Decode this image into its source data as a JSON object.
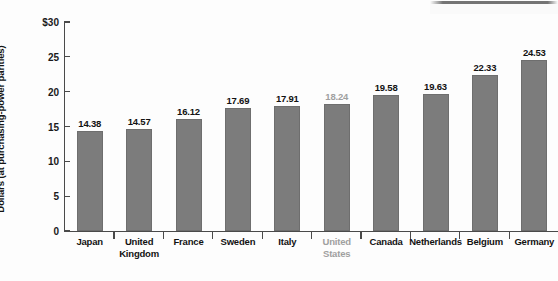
{
  "chart_data": {
    "type": "bar",
    "title": "",
    "xlabel": "",
    "ylabel": "Dollars (at purchasing-power parities)",
    "ylim": [
      0,
      30
    ],
    "ytick_labels": [
      "$30",
      "25",
      "20",
      "15",
      "10",
      "5",
      "0"
    ],
    "ytick_values": [
      30,
      25,
      20,
      15,
      10,
      5,
      0
    ],
    "grid": false,
    "legend": "none",
    "categories": [
      "Japan",
      "United Kingdom",
      "France",
      "Sweden",
      "Italy",
      "United States",
      "Canada",
      "Netherlands",
      "Belgium",
      "Germany"
    ],
    "category_lines": [
      [
        "Japan"
      ],
      [
        "United",
        "Kingdom"
      ],
      [
        "France"
      ],
      [
        "Sweden"
      ],
      [
        "Italy"
      ],
      [
        "United",
        "States"
      ],
      [
        "Canada"
      ],
      [
        "Netherlands"
      ],
      [
        "Belgium"
      ],
      [
        "Germany"
      ]
    ],
    "values": [
      14.38,
      14.57,
      16.12,
      17.69,
      17.91,
      18.24,
      19.58,
      19.63,
      22.33,
      24.53
    ],
    "value_labels": [
      "14.38",
      "14.57",
      "16.12",
      "17.69",
      "17.91",
      "18.24",
      "19.58",
      "19.63",
      "22.33",
      "24.53"
    ],
    "highlighted_index": 5,
    "colors": {
      "bar_fill": "#7c7c7c",
      "bar_stroke": "#6e6e6e",
      "axis": "#4a4a4a",
      "text": "#121212",
      "muted_text": "#a0a0a0",
      "background": "#fdfdfd"
    }
  }
}
